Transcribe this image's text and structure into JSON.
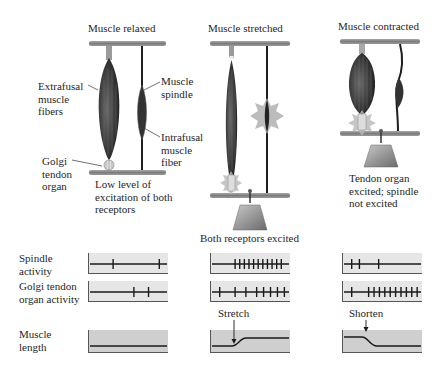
{
  "panels": [
    {
      "id": "relaxed",
      "title": "Muscle relaxed",
      "labels": {
        "extrafusal": "Extrafusal\nmuscle\nfibers",
        "spindle": "Muscle\nspindle",
        "intrafusal": "Intrafusal\nmuscle\nfiber",
        "golgi": "Golgi\ntendon\norgan"
      },
      "caption": "Low level of\nexcitation of both\nreceptors",
      "spindle_spikes": [
        0.3,
        0.9
      ],
      "golgi_spikes": [
        0.57,
        0.76
      ],
      "length_event": ""
    },
    {
      "id": "stretched",
      "title": "Muscle stretched",
      "caption": "Both receptors excited",
      "spindle_spikes": [
        0.3,
        0.36,
        0.42,
        0.48,
        0.54,
        0.6,
        0.66,
        0.72,
        0.78,
        0.84,
        0.9
      ],
      "golgi_spikes": [
        0.1,
        0.3,
        0.44,
        0.58,
        0.67,
        0.76,
        0.85,
        0.94
      ],
      "length_event": "Stretch"
    },
    {
      "id": "contracted",
      "title": "Muscle contracted",
      "caption": "Tendon organ\nexcited; spindle\nnot excited",
      "spindle_spikes": [
        0.1,
        0.2,
        0.45
      ],
      "golgi_spikes": [
        0.1,
        0.32,
        0.39,
        0.46,
        0.53,
        0.6,
        0.67,
        0.74,
        0.81,
        0.88,
        0.95
      ],
      "length_event": "Shorten"
    }
  ],
  "row_labels": {
    "spindle": "Spindle\nactivity",
    "golgi": "Golgi tendon\norgan activity",
    "length": "Muscle\nlength"
  },
  "colors": {
    "bar": "#8a8a8a",
    "muscle": "#3a3a3a",
    "trace_bg": "#e6e6e6",
    "length_bg": "#cfcfcf",
    "star": "#b0b0b0"
  }
}
